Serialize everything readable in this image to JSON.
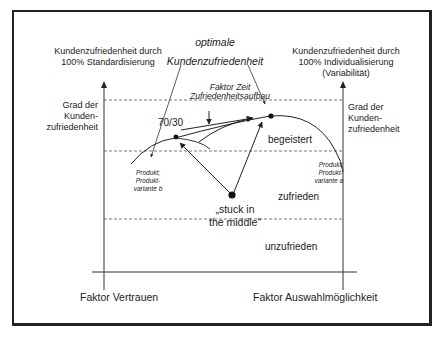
{
  "diagram": {
    "title_top": {
      "line1": "optimale",
      "line2": "Kundenzufriedenheit"
    },
    "left_axis": {
      "heading_line1": "Kundenzufriedenheit durch",
      "heading_line2": "100% Standardisierung",
      "y_label_line1": "Grad der",
      "y_label_line2": "Kunden-",
      "y_label_line3": "zufriedenheit",
      "x_label": "Faktor Vertrauen"
    },
    "right_axis": {
      "heading_line1": "Kundenzufriedenheit durch",
      "heading_line2": "100% Individualisierung",
      "heading_line3": "(Variabilität)",
      "y_label_line1": "Grad der",
      "y_label_line2": "Kunden-",
      "y_label_line3": "zufriedenheit",
      "x_label": "Faktor Auswahlmöglichkeit"
    },
    "annotations": {
      "factor_time_line1": "Faktor Zeit",
      "factor_time_line2": "Zufriedenheitsaufbau",
      "ratio": "70/30",
      "stuck_line1": "„stuck in",
      "stuck_line2": "the middle“",
      "product_b_line1": "Produkt;",
      "product_b_line2": "Produkt-",
      "product_b_line3": "variante b",
      "product_a_line1": "Produkt;",
      "product_a_line2": "Produkt-",
      "product_a_line3": "variante a"
    },
    "zones": {
      "top": "begeistert",
      "middle": "zufrieden",
      "bottom": "unzufrieden"
    },
    "colors": {
      "line": "#222222",
      "dashed": "#444444",
      "background": "#ffffff"
    }
  }
}
